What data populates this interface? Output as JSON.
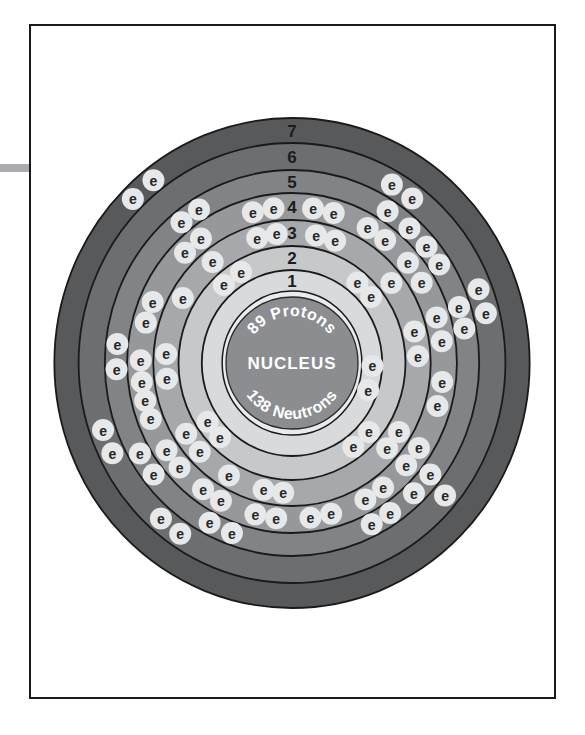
{
  "page": {
    "background_color": "#ffffff",
    "border_color": "#1a1a1a",
    "border_rect": {
      "x": 30,
      "y": 25,
      "width": 525,
      "height": 673
    },
    "margin_bar": {
      "x": 0,
      "y": 164,
      "width": 30,
      "height": 8,
      "color": "#a9abae"
    }
  },
  "atom": {
    "center": {
      "x": 292,
      "y": 363
    },
    "aspect_x": 0.97,
    "ring_stroke_color": "#1a1a1a",
    "ring_stroke_width": 1.8,
    "nucleus": {
      "label": "NUCLEUS",
      "top_text": "89 Protons",
      "bottom_text": "138 Neutrons",
      "protons": 89,
      "neutrons": 138,
      "radius": 66,
      "halo_radius": 72,
      "halo_fill": "#eaebec",
      "fill": "#8b8d90",
      "outline_color": "#2a2a2a",
      "text_color": "#ffffff",
      "label_font_size": 17,
      "arc_font_size": 16,
      "top_text_radius": 47,
      "bottom_text_radius": 56
    },
    "electron": {
      "symbol": "e",
      "halo_fill": "#e7e8e9",
      "halo_radius": 11,
      "text_color": "#262626",
      "font_size": 14
    },
    "shell_number_font_size": 17,
    "shells": [
      {
        "label": "1",
        "outer_radius": 93,
        "label_radius": 82,
        "fill": "#d9dadb",
        "electron_count": 2,
        "electron_radius": 83,
        "electron_angles": [
          92,
          109
        ]
      },
      {
        "label": "2",
        "outer_radius": 117,
        "label_radius": 105,
        "fill": "#c6c8ca",
        "electron_count": 8,
        "electron_radius": 105,
        "electron_angles": [
          40,
          51,
          131,
          143,
          225,
          236,
          318,
          330
        ]
      },
      {
        "label": "3",
        "outer_radius": 143,
        "label_radius": 130,
        "fill": "#a6a8ab",
        "electron_count": 18,
        "electron_radius": 130,
        "electron_angles": [
          11,
          20,
          52,
          76,
          87,
          122,
          131,
          184,
          193,
          210,
          227,
          237,
          263,
          274,
          300,
          321,
          344,
          353
        ]
      },
      {
        "label": "4",
        "outer_radius": 170,
        "label_radius": 156,
        "fill": "#96989b",
        "electron_count": 32,
        "electron_radius": 156,
        "electron_angles": [
          8,
          16,
          30,
          38,
          50,
          59,
          73,
          82,
          97,
          106,
          123,
          131,
          143,
          151,
          165,
          173,
          186,
          194,
          208,
          216,
          228,
          236,
          249,
          256,
          263,
          271,
          285,
          293,
          315,
          323,
          345,
          353
        ]
      },
      {
        "label": "5",
        "outer_radius": 193,
        "label_radius": 181,
        "fill": "#818386",
        "electron_count": 18,
        "electron_radius": 181,
        "electron_angles": [
          33,
          42,
          50,
          57,
          72,
          79,
          128,
          136,
          146,
          153,
          200,
          208,
          232,
          240,
          268,
          276,
          321,
          328
        ]
      },
      {
        "label": "6",
        "outer_radius": 220,
        "label_radius": 206,
        "fill": "#6c6e70",
        "electron_count": 9,
        "electron_radius": 206,
        "electron_angles": [
          30,
          37,
          69,
          76,
          130,
          214,
          221,
          244,
          251
        ]
      },
      {
        "label": "7",
        "outer_radius": 245,
        "label_radius": 232,
        "fill": "#58595b",
        "electron_count": 2,
        "electron_radius": 232,
        "electron_angles": [
          315,
          322
        ]
      }
    ]
  }
}
